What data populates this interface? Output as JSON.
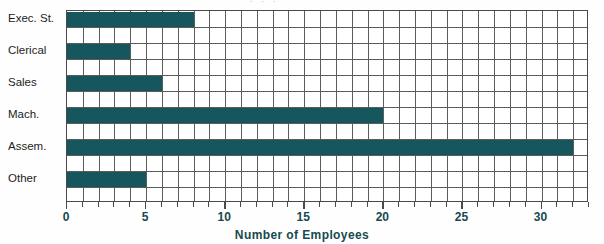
{
  "chart_data": {
    "type": "bar",
    "orientation": "horizontal",
    "title": "",
    "xlabel": "Number of Employees",
    "ylabel": "",
    "categories": [
      "Exec. St.",
      "Clerical",
      "Sales",
      "Mach.",
      "Assem.",
      "Other"
    ],
    "values": [
      8,
      4,
      6,
      20,
      32,
      5
    ],
    "xlim": [
      0,
      33
    ],
    "xticks": [
      0,
      5,
      10,
      15,
      20,
      25,
      30
    ],
    "xtick_labels": [
      "0",
      "5",
      "10",
      "15",
      "20",
      "25",
      "30"
    ],
    "grid": true,
    "grid_minor_step": 1,
    "legend": "none",
    "bar_color": "#15575c",
    "grid_color": "#5c5c5c",
    "axis_color": "#4a4a4a",
    "label_color": "#17494e",
    "background": "#ffffff",
    "rows_total": 12,
    "columns_total": 33,
    "title_remnant": "· · ·"
  }
}
